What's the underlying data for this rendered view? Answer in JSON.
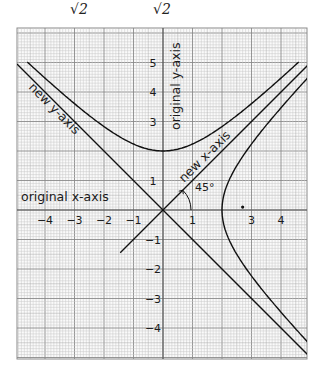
{
  "header": {
    "fragment_left": "N",
    "sqrt_1": "√2",
    "sqrt_2": "√2"
  },
  "figure": {
    "grid": {
      "left": 17,
      "top": 28,
      "right": 307,
      "bottom": 359,
      "origin_x": 163,
      "origin_y": 210,
      "unit_px": 29.5
    },
    "labels": {
      "original_x_axis": "original x-axis",
      "original_y_axis": "original y-axis",
      "new_x_axis": "new x-axis",
      "new_y_axis": "new y-axis",
      "angle": "45°"
    },
    "x_ticks": [
      {
        "value": -4,
        "label": "−4"
      },
      {
        "value": -3,
        "label": "−3"
      },
      {
        "value": -2,
        "label": "−2"
      },
      {
        "value": -1,
        "label": "−1"
      },
      {
        "value": 1,
        "label": "1"
      },
      {
        "value": 3,
        "label": "3"
      },
      {
        "value": 4,
        "label": "4"
      }
    ],
    "y_ticks": [
      {
        "value": 5,
        "label": "5"
      },
      {
        "value": 4,
        "label": "4"
      },
      {
        "value": 3,
        "label": "3"
      },
      {
        "value": 1,
        "label": "1"
      },
      {
        "value": -1,
        "label": "−1"
      },
      {
        "value": -2,
        "label": "−2"
      },
      {
        "value": -3,
        "label": "−3"
      },
      {
        "value": -4,
        "label": "−4"
      }
    ],
    "curves": [
      {
        "name": "upper-hyperbola",
        "equation": "y² − x² = 4",
        "vertex": [
          0,
          2
        ]
      },
      {
        "name": "right-hyperbola",
        "equation": "x² − y² = 4",
        "vertex": [
          2,
          0
        ]
      },
      {
        "name": "new-x-axis",
        "equation": "y = x"
      },
      {
        "name": "new-y-axis",
        "equation": "y = −x"
      }
    ],
    "focus_dot": [
      2.7,
      0.1
    ],
    "colors": {
      "grid_minor": "#c8c8c8",
      "grid_major": "#8a8a8a",
      "ink": "#111111",
      "paper": "#ffffff"
    }
  }
}
